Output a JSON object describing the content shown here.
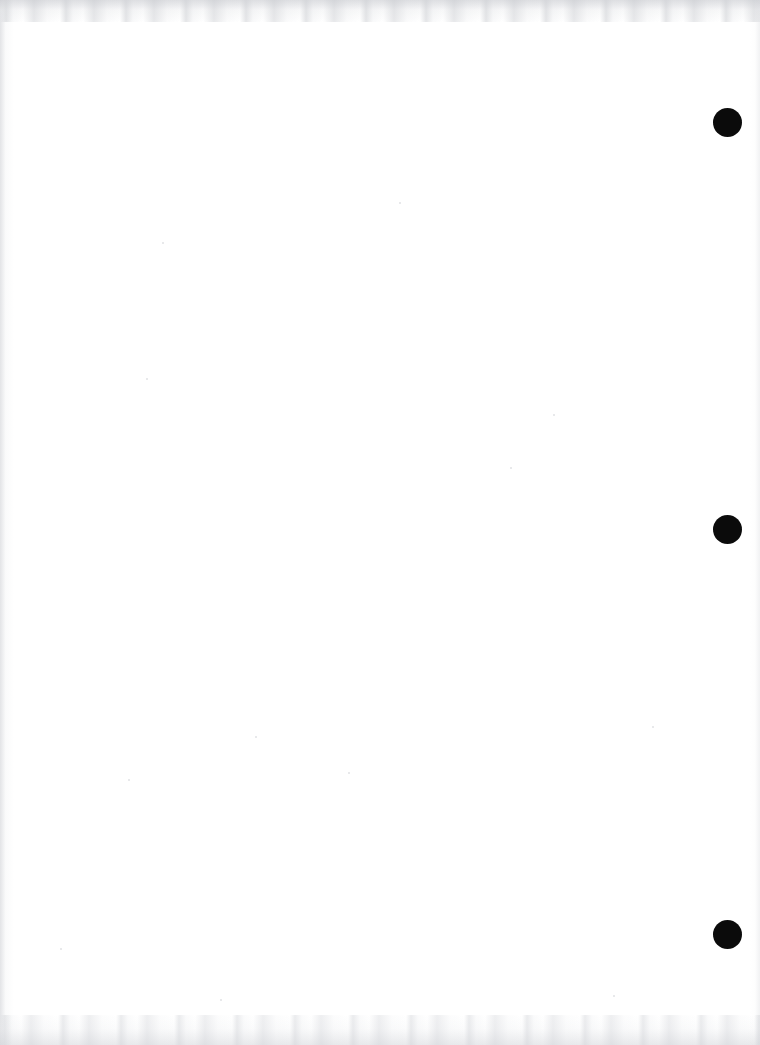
{
  "page": {
    "kind": "scanned-blank-page",
    "width": 760,
    "height": 1045,
    "background_color": "#ffffff",
    "content_text": "",
    "body_description": "Blank white scanned page with no text or printed content"
  },
  "marks": {
    "label": "registration-marks",
    "shape": "circle",
    "color": "#0b0b0b",
    "diameter": 29,
    "count": 3,
    "items": [
      {
        "name": "punch-mark-top",
        "cx": 727,
        "cy": 122,
        "r": 14.5
      },
      {
        "name": "punch-mark-middle",
        "cx": 727,
        "cy": 529,
        "r": 14.5
      },
      {
        "name": "punch-mark-bottom",
        "cx": 727,
        "cy": 934,
        "r": 14.5
      }
    ]
  },
  "artifacts": {
    "noise_color": "#cdd0d4",
    "top_band_height": 22,
    "bottom_band_height": 30,
    "left_shadow_width": 14,
    "right_shadow_width": 10,
    "specks": [
      {
        "x": 162,
        "y": 242,
        "size": 2
      },
      {
        "x": 146,
        "y": 378,
        "size": 2
      },
      {
        "x": 348,
        "y": 772,
        "size": 2
      },
      {
        "x": 553,
        "y": 414,
        "size": 2
      },
      {
        "x": 255,
        "y": 736,
        "size": 2
      },
      {
        "x": 128,
        "y": 779,
        "size": 2
      },
      {
        "x": 399,
        "y": 202,
        "size": 2
      },
      {
        "x": 60,
        "y": 948,
        "size": 2
      },
      {
        "x": 510,
        "y": 467,
        "size": 2
      },
      {
        "x": 652,
        "y": 726,
        "size": 2
      },
      {
        "x": 613,
        "y": 995,
        "size": 2
      },
      {
        "x": 220,
        "y": 999,
        "size": 2
      }
    ]
  }
}
